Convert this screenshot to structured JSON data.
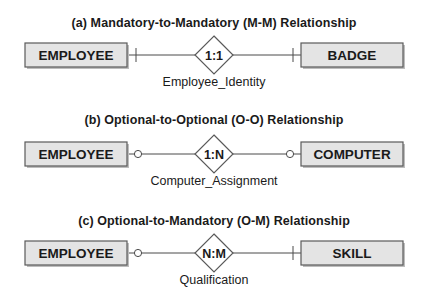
{
  "diagrams": [
    {
      "title": "(a) Mandatory-to-Mandatory (M-M) Relationship",
      "left_entity": "EMPLOYEE",
      "right_entity": "BADGE",
      "cardinality": "1:1",
      "relationship": "Employee_Identity",
      "left_participation": "mandatory",
      "right_participation": "mandatory"
    },
    {
      "title": "(b) Optional-to-Optional (O-O) Relationship",
      "left_entity": "EMPLOYEE",
      "right_entity": "COMPUTER",
      "cardinality": "1:N",
      "relationship": "Computer_Assignment",
      "left_participation": "optional",
      "right_participation": "optional"
    },
    {
      "title": "(c) Optional-to-Mandatory (O-M) Relationship",
      "left_entity": "EMPLOYEE",
      "right_entity": "SKILL",
      "cardinality": "N:M",
      "relationship": "Qualification",
      "left_participation": "optional",
      "right_participation": "mandatory"
    }
  ],
  "colors": {
    "entity_fill": "#e4e4e4",
    "entity_stroke": "#5a5a5a",
    "line": "#4a4a4a"
  }
}
